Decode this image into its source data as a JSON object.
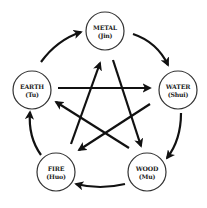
{
  "diagram": {
    "colors": {
      "stroke": "#111111",
      "circle_border": "#333333",
      "text": "#222222",
      "background": "#ffffff"
    },
    "nodes": [
      {
        "id": "metal",
        "name": "METAL",
        "pinyin": "(Jin)",
        "cx": 105,
        "cy": 31,
        "r": 19
      },
      {
        "id": "water",
        "name": "WATER",
        "pinyin": "(Shui)",
        "cx": 178,
        "cy": 90,
        "r": 19
      },
      {
        "id": "wood",
        "name": "WOOD",
        "pinyin": "(Mu)",
        "cx": 147,
        "cy": 172,
        "r": 19
      },
      {
        "id": "fire",
        "name": "FIRE",
        "pinyin": "(Huo)",
        "cx": 56,
        "cy": 172,
        "r": 19
      },
      {
        "id": "earth",
        "name": "EARTH",
        "pinyin": "(Tu)",
        "cx": 32,
        "cy": 90,
        "r": 19
      }
    ],
    "generating_cycle": [
      {
        "from": "earth",
        "to": "metal"
      },
      {
        "from": "metal",
        "to": "water"
      },
      {
        "from": "water",
        "to": "wood"
      },
      {
        "from": "wood",
        "to": "fire"
      },
      {
        "from": "fire",
        "to": "earth"
      }
    ],
    "controlling_cycle": [
      {
        "from": "earth",
        "to": "water"
      },
      {
        "from": "water",
        "to": "fire"
      },
      {
        "from": "fire",
        "to": "metal"
      },
      {
        "from": "metal",
        "to": "wood"
      },
      {
        "from": "wood",
        "to": "earth"
      }
    ]
  }
}
